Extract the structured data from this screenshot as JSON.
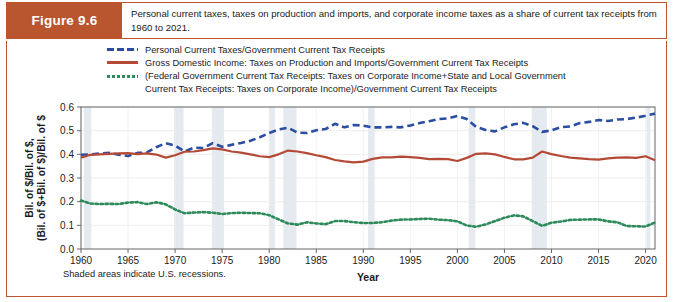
{
  "figure": {
    "badge": "Figure 9.6",
    "caption": "Personal current taxes, taxes on production and imports, and corporate income taxes as a share of current tax receipts from 1960 to 2021."
  },
  "legend": {
    "items": [
      {
        "style": "dashed",
        "color": "#2b4ea2",
        "label": "Personal Current Taxes/Government Current Tax Receipts"
      },
      {
        "style": "solid",
        "color": "#b44a36",
        "label": "Gross Domestic Income: Taxes on Production and Imports/Government Current Tax Receipts"
      },
      {
        "style": "dotted",
        "color": "#2d8a5a",
        "label": "(Federal Government Current Tax Receipts: Taxes on Corporate Income+State and Local Government",
        "label_line2": "Current Tax Receipts: Taxes on Corporate Income)/Government Current Tax Receipts"
      }
    ]
  },
  "footnote": "Shaded areas indicate U.S. recessions.",
  "chart_data": {
    "type": "line",
    "title": "",
    "xlabel": "Year",
    "ylabel": "Bil. of $/Bil. of $, (Bil. of $+Bil. of $)/Bil. of $",
    "ylabel_line1": "Bil. of $/Bil. of $,",
    "ylabel_line2": "(Bil. of $+Bil. of $)/Bil. of $",
    "xlim": [
      1960,
      2021
    ],
    "ylim": [
      0.0,
      0.6
    ],
    "xticks": [
      1960,
      1965,
      1970,
      1975,
      1980,
      1985,
      1990,
      1995,
      2000,
      2005,
      2010,
      2015,
      2020
    ],
    "yticks": [
      0.0,
      0.1,
      0.2,
      0.3,
      0.4,
      0.5,
      0.6
    ],
    "ytick_labels": [
      "0.0",
      "0.1",
      "0.2",
      "0.3",
      "0.4",
      "0.5",
      "0.6"
    ],
    "xtick_labels": [
      "1960",
      "1965",
      "1970",
      "1975",
      "1980",
      "1985",
      "1990",
      "1995",
      "2000",
      "2005",
      "2010",
      "2015",
      "2020"
    ],
    "grid": true,
    "legend_position": "above-plot",
    "recession_bands": [
      [
        1960.3,
        1961.1
      ],
      [
        1969.9,
        1970.9
      ],
      [
        1973.9,
        1975.2
      ],
      [
        1980.0,
        1980.6
      ],
      [
        1981.5,
        1982.9
      ],
      [
        1990.5,
        1991.2
      ],
      [
        2001.2,
        2001.9
      ],
      [
        2007.9,
        2009.5
      ],
      [
        2020.1,
        2020.5
      ]
    ],
    "x": [
      1960,
      1961,
      1962,
      1963,
      1964,
      1965,
      1966,
      1967,
      1968,
      1969,
      1970,
      1971,
      1972,
      1973,
      1974,
      1975,
      1976,
      1977,
      1978,
      1979,
      1980,
      1981,
      1982,
      1983,
      1984,
      1985,
      1986,
      1987,
      1988,
      1989,
      1990,
      1991,
      1992,
      1993,
      1994,
      1995,
      1996,
      1997,
      1998,
      1999,
      2000,
      2001,
      2002,
      2003,
      2004,
      2005,
      2006,
      2007,
      2008,
      2009,
      2010,
      2011,
      2012,
      2013,
      2014,
      2015,
      2016,
      2017,
      2018,
      2019,
      2020,
      2021
    ],
    "series": [
      {
        "name": "Personal Current Taxes/Government Current Tax Receipts",
        "style": "dashed",
        "color": "#2b4ea2",
        "values": [
          0.398,
          0.4,
          0.404,
          0.406,
          0.398,
          0.393,
          0.406,
          0.408,
          0.43,
          0.447,
          0.437,
          0.412,
          0.428,
          0.427,
          0.447,
          0.432,
          0.44,
          0.448,
          0.457,
          0.472,
          0.49,
          0.505,
          0.512,
          0.492,
          0.49,
          0.502,
          0.507,
          0.529,
          0.514,
          0.524,
          0.521,
          0.514,
          0.514,
          0.516,
          0.514,
          0.522,
          0.532,
          0.54,
          0.549,
          0.552,
          0.562,
          0.549,
          0.516,
          0.503,
          0.497,
          0.514,
          0.527,
          0.533,
          0.519,
          0.495,
          0.501,
          0.515,
          0.518,
          0.532,
          0.537,
          0.545,
          0.541,
          0.547,
          0.549,
          0.555,
          0.563,
          0.572
        ]
      },
      {
        "name": "Gross Domestic Income: Taxes on Production and Imports/Government Current Tax Receipts",
        "style": "solid",
        "color": "#b44a36",
        "values": [
          0.386,
          0.398,
          0.4,
          0.402,
          0.404,
          0.405,
          0.401,
          0.404,
          0.399,
          0.386,
          0.396,
          0.411,
          0.412,
          0.418,
          0.425,
          0.421,
          0.412,
          0.407,
          0.4,
          0.392,
          0.388,
          0.4,
          0.416,
          0.412,
          0.405,
          0.396,
          0.388,
          0.376,
          0.37,
          0.366,
          0.369,
          0.381,
          0.387,
          0.387,
          0.39,
          0.388,
          0.385,
          0.38,
          0.381,
          0.38,
          0.372,
          0.385,
          0.402,
          0.404,
          0.4,
          0.389,
          0.379,
          0.379,
          0.386,
          0.412,
          0.401,
          0.393,
          0.386,
          0.383,
          0.38,
          0.378,
          0.383,
          0.386,
          0.387,
          0.385,
          0.392,
          0.375
        ]
      },
      {
        "name": "(Federal Government Current Tax Receipts: Taxes on Corporate Income+State and Local Government Current Tax Receipts: Taxes on Corporate Income)/Government Current Tax Receipts",
        "style": "dotted",
        "color": "#2d8a5a",
        "values": [
          0.205,
          0.192,
          0.19,
          0.191,
          0.19,
          0.196,
          0.198,
          0.19,
          0.197,
          0.189,
          0.167,
          0.151,
          0.154,
          0.156,
          0.153,
          0.148,
          0.152,
          0.153,
          0.152,
          0.151,
          0.143,
          0.125,
          0.108,
          0.103,
          0.113,
          0.108,
          0.105,
          0.118,
          0.118,
          0.113,
          0.11,
          0.11,
          0.113,
          0.12,
          0.124,
          0.125,
          0.127,
          0.128,
          0.124,
          0.122,
          0.117,
          0.099,
          0.094,
          0.104,
          0.118,
          0.132,
          0.142,
          0.138,
          0.118,
          0.098,
          0.111,
          0.116,
          0.123,
          0.124,
          0.125,
          0.125,
          0.117,
          0.113,
          0.097,
          0.096,
          0.095,
          0.112
        ]
      }
    ]
  }
}
